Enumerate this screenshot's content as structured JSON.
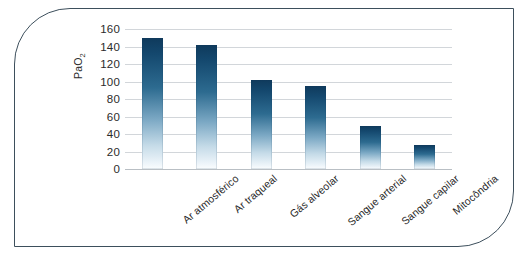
{
  "chart_data": {
    "type": "bar",
    "title": "",
    "xlabel": "",
    "ylabel": "PaO2",
    "ylabel_display": "PaO",
    "ylabel_sub": "2",
    "categories": [
      "Ar atmosférico",
      "Ar traqueal",
      "Gás alveolar",
      "Sangue arterial",
      "Sangue capilar",
      "Mitocôndria"
    ],
    "values": [
      150,
      142,
      102,
      95,
      49,
      27
    ],
    "ylim": [
      0,
      160
    ],
    "yticks": [
      160,
      140,
      120,
      100,
      80,
      60,
      40,
      20,
      0
    ],
    "grid": true,
    "legend": "none",
    "bar_color_top": "#0f3a5c",
    "bar_color_bottom": "#fbfdfe",
    "gridline_color": "#d2d6da",
    "frame_color": "#3d4f5c",
    "background": "#ffffff"
  }
}
